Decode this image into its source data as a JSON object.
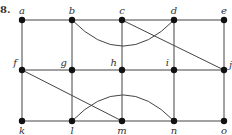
{
  "figure_label": "8.",
  "nodes": [
    {
      "id": "a",
      "label": "a",
      "row": 0,
      "col": 0,
      "label_pos": "above"
    },
    {
      "id": "b",
      "label": "b",
      "row": 0,
      "col": 1,
      "label_pos": "above"
    },
    {
      "id": "c",
      "label": "c",
      "row": 0,
      "col": 2,
      "label_pos": "above"
    },
    {
      "id": "d",
      "label": "d",
      "row": 0,
      "col": 3,
      "label_pos": "above"
    },
    {
      "id": "e",
      "label": "e",
      "row": 0,
      "col": 4,
      "label_pos": "above"
    },
    {
      "id": "f",
      "label": "f",
      "row": 1,
      "col": 0,
      "label_pos": "above-left"
    },
    {
      "id": "g",
      "label": "g",
      "row": 1,
      "col": 1,
      "label_pos": "above-left"
    },
    {
      "id": "h",
      "label": "h",
      "row": 1,
      "col": 2,
      "label_pos": "above-left"
    },
    {
      "id": "i",
      "label": "i",
      "row": 1,
      "col": 3,
      "label_pos": "above-left"
    },
    {
      "id": "j",
      "label": "j",
      "row": 1,
      "col": 4,
      "label_pos": "right"
    },
    {
      "id": "k",
      "label": "k",
      "row": 2,
      "col": 0,
      "label_pos": "below"
    },
    {
      "id": "l",
      "label": "l",
      "row": 2,
      "col": 1,
      "label_pos": "below"
    },
    {
      "id": "m",
      "label": "m",
      "row": 2,
      "col": 2,
      "label_pos": "below"
    },
    {
      "id": "n",
      "label": "n",
      "row": 2,
      "col": 3,
      "label_pos": "below"
    },
    {
      "id": "o",
      "label": "o",
      "row": 2,
      "col": 4,
      "label_pos": "below"
    }
  ],
  "edges": [
    {
      "from": "a",
      "to": "b",
      "type": "line"
    },
    {
      "from": "b",
      "to": "c",
      "type": "line"
    },
    {
      "from": "c",
      "to": "d",
      "type": "line"
    },
    {
      "from": "d",
      "to": "e",
      "type": "line"
    },
    {
      "from": "f",
      "to": "g",
      "type": "line"
    },
    {
      "from": "g",
      "to": "h",
      "type": "line"
    },
    {
      "from": "h",
      "to": "i",
      "type": "line"
    },
    {
      "from": "i",
      "to": "j",
      "type": "line"
    },
    {
      "from": "k",
      "to": "l",
      "type": "line"
    },
    {
      "from": "l",
      "to": "m",
      "type": "line"
    },
    {
      "from": "m",
      "to": "n",
      "type": "line"
    },
    {
      "from": "n",
      "to": "o",
      "type": "line"
    },
    {
      "from": "a",
      "to": "f",
      "type": "line"
    },
    {
      "from": "f",
      "to": "k",
      "type": "line"
    },
    {
      "from": "b",
      "to": "g",
      "type": "line"
    },
    {
      "from": "g",
      "to": "l",
      "type": "line"
    },
    {
      "from": "c",
      "to": "h",
      "type": "line"
    },
    {
      "from": "h",
      "to": "m",
      "type": "line"
    },
    {
      "from": "d",
      "to": "i",
      "type": "line"
    },
    {
      "from": "i",
      "to": "n",
      "type": "line"
    },
    {
      "from": "e",
      "to": "j",
      "type": "line"
    },
    {
      "from": "j",
      "to": "o",
      "type": "line"
    },
    {
      "from": "c",
      "to": "j",
      "type": "line"
    },
    {
      "from": "f",
      "to": "m",
      "type": "line"
    },
    {
      "from": "b",
      "to": "d",
      "type": "arc",
      "bulge": "down"
    },
    {
      "from": "l",
      "to": "n",
      "type": "arc",
      "bulge": "up"
    }
  ]
}
